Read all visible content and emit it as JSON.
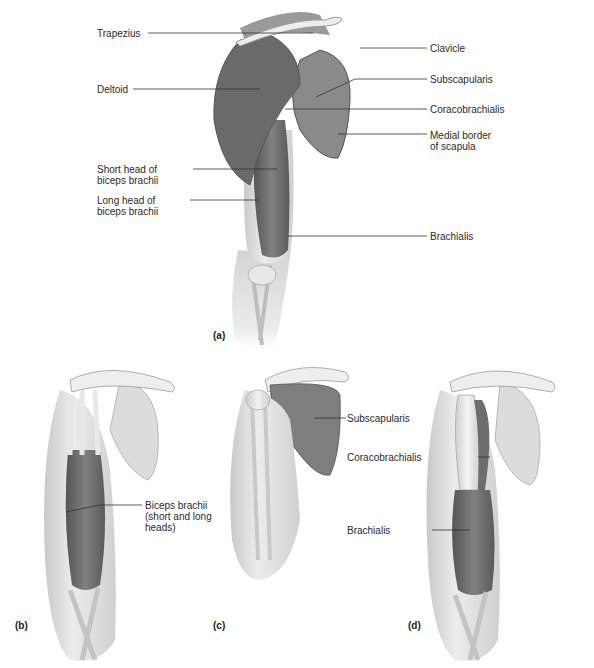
{
  "figure": {
    "panels": [
      {
        "id": "a",
        "label": "(a)",
        "labels": [
          {
            "text": "Trapezius"
          },
          {
            "text": "Deltoid"
          },
          {
            "text": "Short head of",
            "text2": "biceps brachii"
          },
          {
            "text": "Long head of",
            "text2": "biceps brachii"
          },
          {
            "text": "Clavicle"
          },
          {
            "text": "Subscapularis"
          },
          {
            "text": "Coracobrachialis"
          },
          {
            "text": "Medial border",
            "text2": "of scapula"
          },
          {
            "text": "Brachialis"
          }
        ]
      },
      {
        "id": "b",
        "label": "(b)",
        "labels": [
          {
            "text": "Biceps brachii",
            "text2": "(short and long",
            "text3": "heads)"
          }
        ]
      },
      {
        "id": "c",
        "label": "(c)",
        "labels": [
          {
            "text": "Subscapularis"
          }
        ]
      },
      {
        "id": "d",
        "label": "(d)",
        "labels": [
          {
            "text": "Coracobrachialis"
          },
          {
            "text": "Brachialis"
          }
        ]
      }
    ],
    "colors": {
      "muscle": "#7a7a7a",
      "muscle_dark": "#5c5c5c",
      "bone": "#e4e4e4",
      "skin": "#d6d6d6",
      "leader_line": "#333333"
    }
  }
}
